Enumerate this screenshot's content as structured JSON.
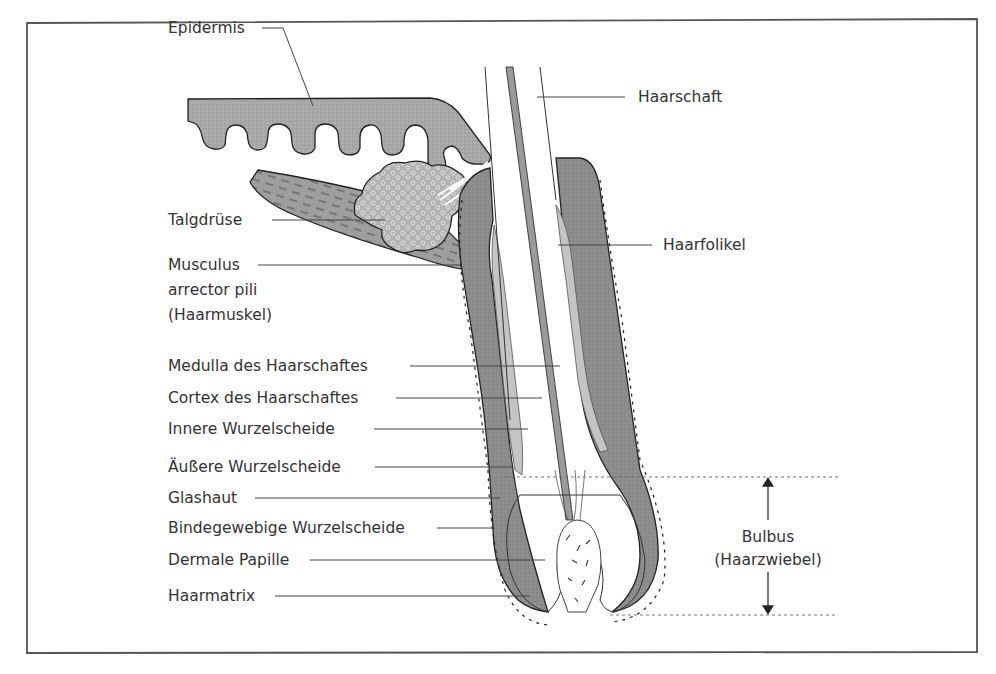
{
  "diagram": {
    "colors": {
      "frame": "#555555",
      "epidermis": "#a3a3a3",
      "outer_root_sheath": "#8a8a8a",
      "inner_root_sheath": "#c2c2c2",
      "muscle": "#9a9a9a",
      "gland": "#b5b5b5",
      "text": "#333333"
    },
    "labels_left": [
      {
        "id": "epidermis",
        "text": "Epidermis"
      },
      {
        "id": "talgdruese",
        "text": "Talgdrüse"
      },
      {
        "id": "musculus_1",
        "text": "Musculus"
      },
      {
        "id": "musculus_2",
        "text": "arrector pili"
      },
      {
        "id": "musculus_3",
        "text": "(Haarmuskel)"
      },
      {
        "id": "medulla",
        "text": "Medulla des Haarschaftes"
      },
      {
        "id": "cortex",
        "text": "Cortex des Haarschaftes"
      },
      {
        "id": "innere",
        "text": "Innere Wurzelscheide"
      },
      {
        "id": "aeussere",
        "text": "Äußere Wurzelscheide"
      },
      {
        "id": "glashaut",
        "text": "Glashaut"
      },
      {
        "id": "bindegewebige",
        "text": "Bindegewebige Wurzelscheide"
      },
      {
        "id": "papille",
        "text": "Dermale Papille"
      },
      {
        "id": "haarmatrix",
        "text": "Haarmatrix"
      }
    ],
    "labels_right": [
      {
        "id": "haarschaft",
        "text": "Haarschaft"
      },
      {
        "id": "haarfolikel",
        "text": "Haarfolikel"
      },
      {
        "id": "bulbus_1",
        "text": "Bulbus"
      },
      {
        "id": "bulbus_2",
        "text": "(Haarzwiebel)"
      }
    ]
  }
}
